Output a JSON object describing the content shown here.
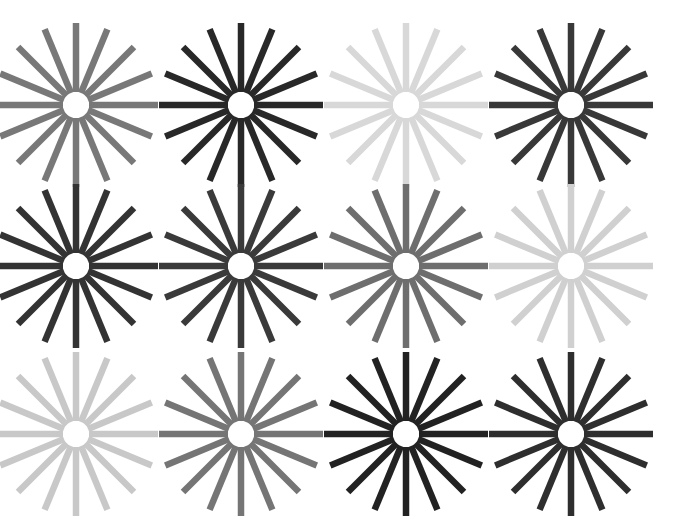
{
  "figure": {
    "background_color": "#ffffff",
    "width": 687,
    "height": 528,
    "rows": 3,
    "columns": 4,
    "cell_count": 12,
    "hub_color": "#ffffff"
  },
  "chart_data": {
    "type": "heatmap",
    "subtitle": "",
    "xlabel": "",
    "ylabel": "",
    "grid": false,
    "legend": "none",
    "rows": 3,
    "columns": 4,
    "categories": [
      "col-1",
      "col-2",
      "col-3",
      "col-4"
    ],
    "row_labels": [
      "row-1",
      "row-2",
      "row-3"
    ],
    "value_meaning": "gray_level_0_to_255 (spoke stroke lightness)",
    "series": [
      {
        "name": "row-1",
        "values": [
          120,
          40,
          216,
          56
        ]
      },
      {
        "name": "row-2",
        "values": [
          51,
          58,
          110,
          208
        ]
      },
      {
        "name": "row-3",
        "values": [
          200,
          117,
          34,
          46
        ]
      }
    ],
    "cells": [
      {
        "id": "cell-r1c1",
        "row": 1,
        "col": 1,
        "center_x": 76,
        "center_y": 105,
        "spokes": 16,
        "inner_radius": 13,
        "outer_radius": 82,
        "spoke_width": 6.5,
        "hub_radius": 10,
        "color": "#787878",
        "gray_level": 120,
        "shade_label": "medium gray"
      },
      {
        "id": "cell-r1c2",
        "row": 1,
        "col": 2,
        "center_x": 241,
        "center_y": 105,
        "spokes": 16,
        "inner_radius": 13,
        "outer_radius": 82,
        "spoke_width": 6.5,
        "hub_radius": 10,
        "color": "#282828",
        "gray_level": 40,
        "shade_label": "very dark gray"
      },
      {
        "id": "cell-r1c3",
        "row": 1,
        "col": 3,
        "center_x": 406,
        "center_y": 105,
        "spokes": 16,
        "inner_radius": 13,
        "outer_radius": 82,
        "spoke_width": 6.5,
        "hub_radius": 10,
        "color": "#d8d8d8",
        "gray_level": 216,
        "shade_label": "very light gray"
      },
      {
        "id": "cell-r1c4",
        "row": 1,
        "col": 4,
        "center_x": 571,
        "center_y": 105,
        "spokes": 16,
        "inner_radius": 13,
        "outer_radius": 82,
        "spoke_width": 6.5,
        "hub_radius": 10,
        "color": "#383838",
        "gray_level": 56,
        "shade_label": "dark gray"
      },
      {
        "id": "cell-r2c1",
        "row": 2,
        "col": 1,
        "center_x": 76,
        "center_y": 266,
        "spokes": 16,
        "inner_radius": 13,
        "outer_radius": 82,
        "spoke_width": 6.5,
        "hub_radius": 10,
        "color": "#333333",
        "gray_level": 51,
        "shade_label": "dark gray"
      },
      {
        "id": "cell-r2c2",
        "row": 2,
        "col": 2,
        "center_x": 241,
        "center_y": 266,
        "spokes": 16,
        "inner_radius": 13,
        "outer_radius": 82,
        "spoke_width": 6.5,
        "hub_radius": 10,
        "color": "#3a3a3a",
        "gray_level": 58,
        "shade_label": "dark gray"
      },
      {
        "id": "cell-r2c3",
        "row": 2,
        "col": 3,
        "center_x": 406,
        "center_y": 266,
        "spokes": 16,
        "inner_radius": 13,
        "outer_radius": 82,
        "spoke_width": 6.5,
        "hub_radius": 10,
        "color": "#6e6e6e",
        "gray_level": 110,
        "shade_label": "medium gray"
      },
      {
        "id": "cell-r2c4",
        "row": 2,
        "col": 4,
        "center_x": 571,
        "center_y": 266,
        "spokes": 16,
        "inner_radius": 13,
        "outer_radius": 82,
        "spoke_width": 6.5,
        "hub_radius": 10,
        "color": "#d0d0d0",
        "gray_level": 208,
        "shade_label": "very light gray"
      },
      {
        "id": "cell-r3c1",
        "row": 3,
        "col": 1,
        "center_x": 76,
        "center_y": 434,
        "spokes": 16,
        "inner_radius": 13,
        "outer_radius": 82,
        "spoke_width": 6.5,
        "hub_radius": 10,
        "color": "#c8c8c8",
        "gray_level": 200,
        "shade_label": "light gray"
      },
      {
        "id": "cell-r3c2",
        "row": 3,
        "col": 2,
        "center_x": 241,
        "center_y": 434,
        "spokes": 16,
        "inner_radius": 13,
        "outer_radius": 82,
        "spoke_width": 6.5,
        "hub_radius": 10,
        "color": "#757575",
        "gray_level": 117,
        "shade_label": "medium gray"
      },
      {
        "id": "cell-r3c3",
        "row": 3,
        "col": 3,
        "center_x": 406,
        "center_y": 434,
        "spokes": 16,
        "inner_radius": 13,
        "outer_radius": 82,
        "spoke_width": 6.5,
        "hub_radius": 10,
        "color": "#222222",
        "gray_level": 34,
        "shade_label": "near black"
      },
      {
        "id": "cell-r3c4",
        "row": 3,
        "col": 4,
        "center_x": 571,
        "center_y": 434,
        "spokes": 16,
        "inner_radius": 13,
        "outer_radius": 82,
        "spoke_width": 6.5,
        "hub_radius": 10,
        "color": "#2e2e2e",
        "gray_level": 46,
        "shade_label": "near black"
      }
    ]
  }
}
